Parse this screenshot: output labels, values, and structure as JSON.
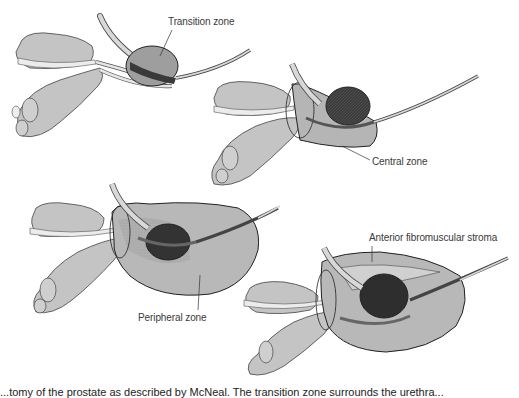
{
  "figure": {
    "panels": [
      {
        "id": "transition",
        "label": "Transition zone"
      },
      {
        "id": "central",
        "label": "Central zone"
      },
      {
        "id": "peripheral",
        "label": "Peripheral zone"
      },
      {
        "id": "anterior",
        "label": "Anterior fibromuscular stroma"
      }
    ],
    "caption": "...tomy of the prostate as described by McNeal. The transition zone surrounds the urethra..."
  },
  "colors": {
    "gland": "#bdbdbd",
    "vesicle": "#c8c8c8",
    "nodule_dark": "#3a3a3a",
    "outline": "#222222",
    "urethra": "#d6d6d6"
  }
}
